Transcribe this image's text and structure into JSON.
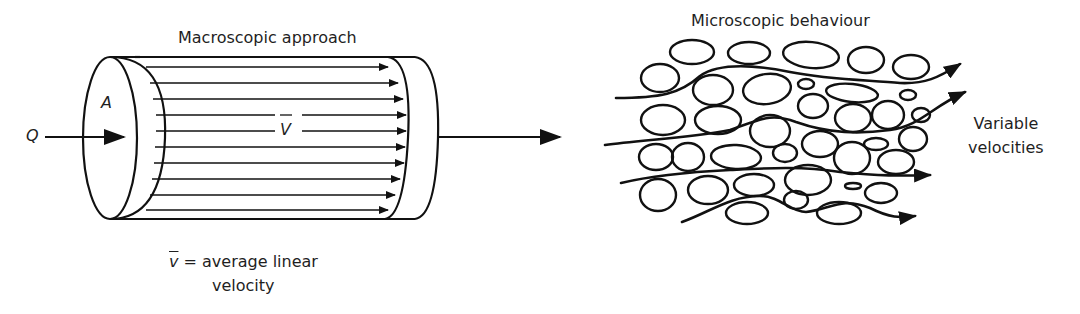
{
  "figure": {
    "left_panel": {
      "title": "Macroscopic approach",
      "area_label": "A",
      "flow_label": "Q",
      "mean_velocity_label": "V",
      "caption_line1": "= average linear",
      "caption_symbol": "v",
      "caption_line2": "velocity"
    },
    "right_panel": {
      "title": "Microscopic behaviour",
      "side_label_line1": "Variable",
      "side_label_line2": "velocities"
    },
    "colors": {
      "stroke": "#111111",
      "background": "#ffffff",
      "text": "#1f1f1f"
    }
  }
}
